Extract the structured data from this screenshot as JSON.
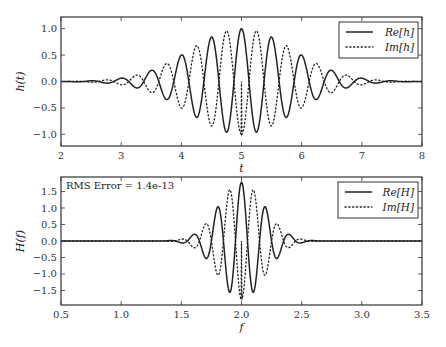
{
  "chart_data": [
    {
      "type": "line",
      "title": "",
      "xlabel": "t",
      "ylabel": "h(t)",
      "xlim": [
        2,
        8
      ],
      "ylim": [
        -1.22,
        1.22
      ],
      "xticks": [
        2,
        3,
        4,
        5,
        6,
        7,
        8
      ],
      "xtick_labels": [
        "2",
        "3",
        "4",
        "5",
        "6",
        "7",
        "8"
      ],
      "yticks": [
        1.0,
        0.5,
        0.0,
        -0.5,
        -1.0
      ],
      "ytick_labels": [
        "1.0",
        "0.5",
        "0.0",
        "−0.5",
        "−1.0"
      ],
      "grid": false,
      "legend_position": "upper right",
      "model": {
        "center": 5.0,
        "sigma": 0.85,
        "freq": 2.0,
        "amplitude": 1.0
      },
      "series": [
        {
          "name": "Re[h]",
          "legend_label": "Re[h]",
          "style": "solid",
          "component": "re",
          "peaks": [
            {
              "x": 3.5,
              "y": 0.11
            },
            {
              "x": 4.0,
              "y": 0.38
            },
            {
              "x": 4.5,
              "y": 0.79
            },
            {
              "x": 5.0,
              "y": 1.0
            },
            {
              "x": 5.5,
              "y": 0.78
            },
            {
              "x": 6.0,
              "y": 0.37
            },
            {
              "x": 6.5,
              "y": 0.11
            }
          ],
          "troughs": [
            {
              "x": 3.75,
              "y": -0.21
            },
            {
              "x": 4.25,
              "y": -0.58
            },
            {
              "x": 4.75,
              "y": -0.93
            },
            {
              "x": 5.25,
              "y": -0.93
            },
            {
              "x": 5.75,
              "y": -0.58
            },
            {
              "x": 6.25,
              "y": -0.21
            }
          ]
        },
        {
          "name": "Im[h]",
          "legend_label": "Im[h]",
          "style": "dotted",
          "component": "im",
          "peaks": [
            {
              "x": 3.62,
              "y": 0.16
            },
            {
              "x": 4.12,
              "y": 0.48
            },
            {
              "x": 4.62,
              "y": 0.88
            },
            {
              "x": 5.12,
              "y": 0.98
            },
            {
              "x": 5.62,
              "y": 0.68
            },
            {
              "x": 6.12,
              "y": 0.28
            }
          ],
          "troughs": [
            {
              "x": 3.87,
              "y": -0.28
            },
            {
              "x": 4.37,
              "y": -0.7
            },
            {
              "x": 4.87,
              "y": -0.99
            },
            {
              "x": 5.37,
              "y": -0.85
            },
            {
              "x": 5.87,
              "y": -0.46
            },
            {
              "x": 6.37,
              "y": -0.14
            }
          ]
        }
      ]
    },
    {
      "type": "line",
      "title": "",
      "xlabel": "f",
      "ylabel": "H(f)",
      "xlim": [
        0.5,
        3.5
      ],
      "ylim": [
        -1.94,
        1.94
      ],
      "xticks": [
        0.5,
        1.0,
        1.5,
        2.0,
        2.5,
        3.0,
        3.5
      ],
      "xtick_labels": [
        "0.5",
        "1.0",
        "1.5",
        "2.0",
        "2.5",
        "3.0",
        "3.5"
      ],
      "yticks": [
        1.5,
        1.0,
        0.5,
        0.0,
        -0.5,
        -1.0,
        -1.5
      ],
      "ytick_labels": [
        "1.5",
        "1.0",
        "0.5",
        "0.0",
        "−0.5",
        "−1.0",
        "−1.5"
      ],
      "grid": false,
      "legend_position": "upper right",
      "annotation": "RMS Error = 1.4e-13",
      "model": {
        "center": 2.0,
        "sigma": 0.19,
        "freq": 5.0,
        "amplitude": 1.78
      },
      "series": [
        {
          "name": "Re[H]",
          "legend_label": "Re[H]",
          "style": "solid",
          "component": "re",
          "peaks": [
            {
              "x": 1.4,
              "y": 0.06
            },
            {
              "x": 1.6,
              "y": 0.39
            },
            {
              "x": 1.8,
              "y": 1.2
            },
            {
              "x": 2.0,
              "y": 1.77
            },
            {
              "x": 2.2,
              "y": 1.2
            },
            {
              "x": 2.4,
              "y": 0.38
            },
            {
              "x": 2.6,
              "y": 0.06
            }
          ],
          "troughs": [
            {
              "x": 1.5,
              "y": -0.15
            },
            {
              "x": 1.7,
              "y": -0.74
            },
            {
              "x": 1.9,
              "y": -1.6
            },
            {
              "x": 2.1,
              "y": -1.6
            },
            {
              "x": 2.3,
              "y": -0.74
            },
            {
              "x": 2.5,
              "y": -0.15
            }
          ]
        },
        {
          "name": "Im[H]",
          "legend_label": "Im[H]",
          "style": "dotted",
          "component": "im",
          "peaks": [
            {
              "x": 1.55,
              "y": 0.25
            },
            {
              "x": 1.75,
              "y": 0.98
            },
            {
              "x": 1.95,
              "y": 1.7
            },
            {
              "x": 2.15,
              "y": 1.45
            },
            {
              "x": 2.35,
              "y": 0.6
            }
          ],
          "troughs": [
            {
              "x": 1.65,
              "y": -0.45
            },
            {
              "x": 1.85,
              "y": -1.4
            },
            {
              "x": 2.05,
              "y": -1.75
            },
            {
              "x": 2.25,
              "y": -1.0
            },
            {
              "x": 2.45,
              "y": -0.28
            }
          ]
        }
      ]
    }
  ],
  "plots": [
    {
      "frame": {
        "x": 61,
        "y": 17,
        "w": 361,
        "h": 129
      },
      "legend": {
        "x": 339,
        "y": 22,
        "w": 79,
        "h": 36,
        "labels": [
          "Re[h]",
          "Im[h]"
        ]
      }
    },
    {
      "frame": {
        "x": 61,
        "y": 177,
        "w": 361,
        "h": 128
      },
      "legend": {
        "x": 338,
        "y": 182,
        "w": 80,
        "h": 36,
        "labels": [
          "Re[H]",
          "Im[H]"
        ]
      },
      "annotation": "RMS Error = 1.4e-13"
    }
  ],
  "colors": {
    "line": "#222222",
    "frame": "#333333",
    "background": "#ffffff"
  }
}
